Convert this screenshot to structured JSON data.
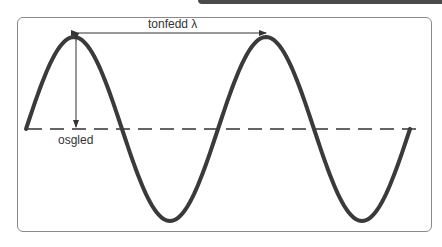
{
  "diagram": {
    "labels": {
      "wavelength": "tonfedd λ",
      "amplitude": "osgled"
    },
    "colors": {
      "wave": "#3a3a3a",
      "frame": "#8a8a8a",
      "topbar": "#4a4a4a",
      "text": "#333333"
    },
    "wave": {
      "start_x": 26,
      "baseline_y": 129,
      "amplitude_px": 92,
      "wavelength_px": 192,
      "cycles": 2
    }
  }
}
